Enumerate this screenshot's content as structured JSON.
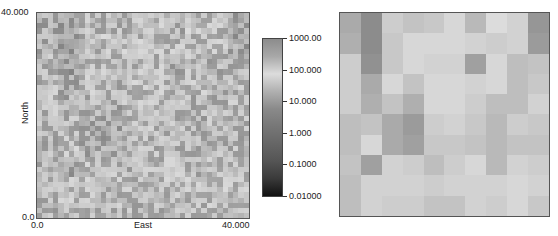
{
  "left_plot": {
    "x_axis": {
      "label": "East",
      "min_label": "0.0",
      "max_label": "40.000"
    },
    "y_axis": {
      "label": "North",
      "min_label": "0.0",
      "max_label": "40.000"
    },
    "grid_size": 40
  },
  "colorbar": {
    "ticks": [
      "1000.00",
      "100.000",
      "10.000",
      "1.000",
      "0.1000",
      "0.01000"
    ],
    "stops": [
      "#8c8c8c",
      "#a8a8a8",
      "#dcdcdc",
      "#b0b0b0",
      "#8a8a8a",
      "#777777",
      "#666666",
      "#555555",
      "#3a3a3a",
      "#111111"
    ]
  },
  "right_plot": {
    "grid_size": 10
  },
  "chart_data": [
    {
      "type": "heatmap",
      "title": "",
      "xlabel": "East",
      "ylabel": "North",
      "xlim": [
        0.0,
        40.0
      ],
      "ylim": [
        0.0,
        40.0
      ],
      "x_tick_labels": [
        "0.0",
        "40.000"
      ],
      "y_tick_labels": [
        "0.0",
        "40.000"
      ],
      "grid": false,
      "colorscale": "log grayscale",
      "colorbar": {
        "min": 0.01,
        "max": 1000,
        "ticks": [
          1000,
          100,
          10,
          1,
          0.1,
          0.01
        ],
        "tick_labels": [
          "1000.00",
          "100.000",
          "10.000",
          "1.000",
          "0.1000",
          "0.01000"
        ],
        "position": "right"
      },
      "resolution": [
        40,
        40
      ],
      "note": "fine-scale random field; values span ~0.1 to ~100"
    },
    {
      "type": "heatmap",
      "title": "",
      "xlabel": "",
      "ylabel": "",
      "grid": false,
      "resolution": [
        10,
        10
      ],
      "gray_values_top_to_bottom": [
        [
          170,
          140,
          205,
          195,
          200,
          215,
          185,
          220,
          210,
          150
        ],
        [
          175,
          140,
          200,
          215,
          215,
          215,
          210,
          205,
          210,
          155
        ],
        [
          205,
          145,
          200,
          215,
          210,
          210,
          160,
          215,
          190,
          195
        ],
        [
          205,
          170,
          215,
          195,
          215,
          215,
          210,
          215,
          190,
          200
        ],
        [
          205,
          175,
          195,
          175,
          215,
          215,
          205,
          190,
          190,
          210
        ],
        [
          190,
          195,
          170,
          155,
          205,
          210,
          200,
          185,
          205,
          200
        ],
        [
          190,
          215,
          170,
          160,
          200,
          200,
          195,
          185,
          195,
          195
        ],
        [
          195,
          160,
          210,
          205,
          190,
          205,
          215,
          185,
          210,
          205
        ],
        [
          190,
          210,
          210,
          210,
          205,
          210,
          210,
          210,
          215,
          210
        ],
        [
          190,
          210,
          205,
          205,
          195,
          195,
          210,
          205,
          215,
          200
        ]
      ]
    }
  ]
}
